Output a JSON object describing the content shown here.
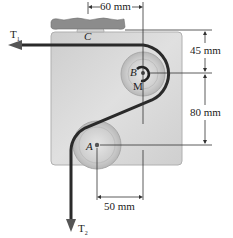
{
  "figure": {
    "type": "mechanics diagram: belt over pulleys on a plate",
    "labels": {
      "support": "C",
      "pulley_upper": "B",
      "motor": "M",
      "pulley_lower": "A"
    },
    "forces": {
      "top_tension": {
        "label": "T",
        "subscript": "1",
        "direction": "left"
      },
      "bottom_tension": {
        "label": "T",
        "subscript": "2",
        "direction": "down"
      }
    },
    "dimensions": {
      "horizontal_top": "60 mm",
      "horizontal_bottom": "50 mm",
      "vertical_upper": "45 mm",
      "vertical_lower": "80 mm"
    },
    "colors": {
      "plate": "#d6d6d6",
      "support": "#8a8a8a",
      "belt": "#2a2a2a",
      "pulley": "#cfcfcf",
      "dimension_lines": "#333333"
    }
  }
}
